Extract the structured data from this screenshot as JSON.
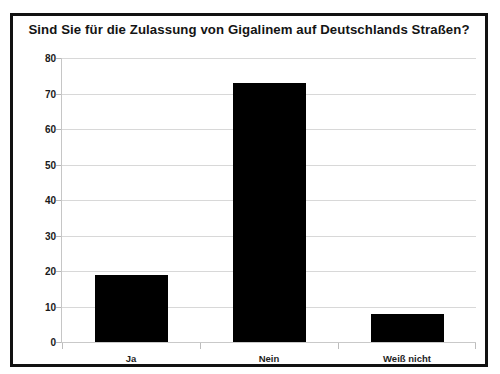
{
  "chart_data": {
    "type": "bar",
    "title": "Sind Sie für die Zulassung von Gigalinem auf Deutschlands Straßen?",
    "categories": [
      "Ja",
      "Nein",
      "Weiß nicht"
    ],
    "values": [
      19,
      73,
      8
    ],
    "xlabel": "",
    "ylabel": "",
    "ylim": [
      0,
      80
    ],
    "yticks": [
      0,
      10,
      20,
      30,
      40,
      50,
      60,
      70,
      80
    ],
    "ytick_labels": [
      "0",
      "10",
      "20",
      "30",
      "40",
      "50",
      "60",
      "70",
      "80"
    ],
    "grid": true,
    "legend": false,
    "bar_color": "#000000",
    "background_color": "#ffffff",
    "border_color": "#111111",
    "gridline_color": "#d8d8d8"
  }
}
